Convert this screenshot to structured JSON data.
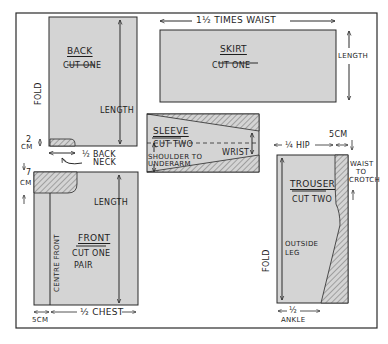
{
  "colors": {
    "fabric": "#d4d4d4",
    "stroke": "#2a2a2a",
    "hatch": "#6a6a6a",
    "background": "#ffffff"
  },
  "pieces": {
    "back": {
      "title": "BACK",
      "instruction": "CUT ONE",
      "length_label": "LENGTH",
      "fold_label": "FOLD",
      "neck_depth_value": "2",
      "neck_depth_unit": "CM",
      "neck_width_label_1": "½ BACK",
      "neck_width_label_2": "NECK"
    },
    "skirt": {
      "title": "SKIRT",
      "instruction": "CUT ONE",
      "width_label": "1½ TIMES WAIST",
      "length_label": "LENGTH"
    },
    "sleeve": {
      "title": "SLEEVE",
      "instruction": "CUT TWO",
      "wrist_label": "WRIST",
      "height_label_1": "SHOULDER TO",
      "height_label_2": "UNDERARM"
    },
    "front": {
      "title": "FRONT",
      "instruction_1": "CUT ONE",
      "instruction_2": "PAIR",
      "length_label": "LENGTH",
      "centre_label": "CENTRE FRONT",
      "neck_depth_value": "7",
      "neck_depth_unit": "CM",
      "extension_label": "5CM",
      "width_label": "½ CHEST"
    },
    "trouser": {
      "title": "TROUSER",
      "instruction": "CUT TWO",
      "width_label": "¼ HIP",
      "crotch_ext_label": "5CM",
      "waist_label_1": "WAIST",
      "waist_label_2": "TO",
      "waist_label_3": "CROTCH",
      "leg_label_1": "OUTSIDE",
      "leg_label_2": "LEG",
      "fold_label": "FOLD",
      "ankle_label_1": "½",
      "ankle_label_2": "ANKLE"
    }
  }
}
